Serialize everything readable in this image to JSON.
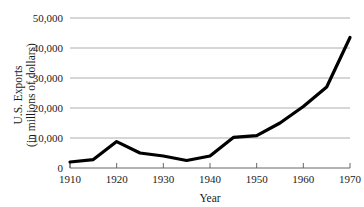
{
  "chart_data": {
    "type": "line",
    "title": "",
    "xlabel": "Year",
    "ylabel": "U.S. Exports (in millions of dollars)",
    "ylabel_line1": "U.S. Exports",
    "ylabel_line2": "(in millions of dollars)",
    "x": [
      1910,
      1915,
      1920,
      1925,
      1930,
      1935,
      1940,
      1945,
      1950,
      1955,
      1960,
      1965,
      1970
    ],
    "values": [
      2000,
      2800,
      8800,
      5000,
      4000,
      2500,
      4000,
      10200,
      10800,
      15000,
      20500,
      27000,
      43500
    ],
    "series": [
      {
        "name": "U.S. Exports",
        "values": [
          2000,
          2800,
          8800,
          5000,
          4000,
          2500,
          4000,
          10200,
          10800,
          15000,
          20500,
          27000,
          43500
        ]
      }
    ],
    "xlim": [
      1910,
      1970
    ],
    "ylim": [
      0,
      50000
    ],
    "grid": true,
    "legend": false,
    "legend_position": "none",
    "line_color": "#000000",
    "grid_color": "#9a9a9a",
    "y_ticks": [
      0,
      10000,
      20000,
      30000,
      40000,
      50000
    ],
    "y_tick_labels": [
      "0",
      "10,000",
      "20,000",
      "30,000",
      "40,000",
      "50,000"
    ],
    "x_ticks": [
      1910,
      1920,
      1930,
      1940,
      1950,
      1960,
      1970
    ],
    "x_tick_labels": [
      "1910",
      "1920",
      "1930",
      "1940",
      "1950",
      "1960",
      "1970"
    ]
  }
}
